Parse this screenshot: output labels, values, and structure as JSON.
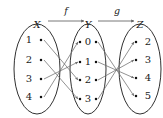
{
  "diagram": {
    "colors": {
      "ellipse": "#1a1a1a",
      "arrow": "#6e6e6e",
      "top_arrow": "#555555",
      "dot": "#111111",
      "text": "#1a1a1a",
      "background": "#ffffff"
    },
    "top_labels": {
      "set_x": "X",
      "map_f": "f",
      "set_y": "Y",
      "map_g": "g",
      "set_z": "Z"
    },
    "sets": [
      {
        "name": "X",
        "label": "X",
        "cx": 37,
        "cy": 69,
        "rx": 23,
        "ry": 45,
        "elements": [
          {
            "label": "1",
            "tx": 29,
            "ty": 40,
            "dx": 41,
            "dy": 40
          },
          {
            "label": "2",
            "tx": 29,
            "ty": 60,
            "dx": 41,
            "dy": 60
          },
          {
            "label": "3",
            "tx": 29,
            "ty": 79,
            "dx": 41,
            "dy": 79
          },
          {
            "label": "4",
            "tx": 29,
            "ty": 97,
            "dx": 41,
            "dy": 97
          }
        ]
      },
      {
        "name": "Y",
        "label": "Y",
        "cx": 88,
        "cy": 69,
        "rx": 18,
        "ry": 45,
        "elements": [
          {
            "label": "0",
            "tx": 88,
            "ty": 42,
            "dx_in": 80,
            "dy": 42,
            "dx_out": 96
          },
          {
            "label": "1",
            "tx": 88,
            "ty": 62,
            "dx_in": 80,
            "dy": 62,
            "dx_out": 96
          },
          {
            "label": "2",
            "tx": 88,
            "ty": 80,
            "dx_in": 80,
            "dy": 80,
            "dx_out": 96
          },
          {
            "label": "3",
            "tx": 88,
            "ty": 99,
            "dx_in": 80,
            "dy": 99,
            "dx_out": 96
          }
        ]
      },
      {
        "name": "Z",
        "label": "Z",
        "cx": 140,
        "cy": 69,
        "rx": 21,
        "ry": 45,
        "elements": [
          {
            "label": "2",
            "tx": 148,
            "ty": 42,
            "dx": 136,
            "dy": 42
          },
          {
            "label": "3",
            "tx": 148,
            "ty": 60,
            "dx": 136,
            "dy": 60
          },
          {
            "label": "4",
            "tx": 148,
            "ty": 78,
            "dx": 136,
            "dy": 78
          },
          {
            "label": "5",
            "tx": 148,
            "ty": 96,
            "dx": 136,
            "dy": 96
          }
        ]
      }
    ],
    "mappings": {
      "f": {
        "label": "f",
        "domain": "X",
        "codomain": "Y",
        "edges": [
          {
            "from": "1",
            "to": "2",
            "x1": 44,
            "y1": 40,
            "x2": 78,
            "y2": 80
          },
          {
            "from": "2",
            "to": "3",
            "x1": 44,
            "y1": 60,
            "x2": 78,
            "y2": 99
          },
          {
            "from": "3",
            "to": "1",
            "x1": 44,
            "y1": 79,
            "x2": 78,
            "y2": 62
          },
          {
            "from": "4",
            "to": "0",
            "x1": 44,
            "y1": 97,
            "x2": 78,
            "y2": 42
          }
        ]
      },
      "g": {
        "label": "g",
        "domain": "Y",
        "codomain": "Z",
        "crossing_point": {
          "x": 113,
          "y": 64
        },
        "edges": [
          {
            "from": "0",
            "to": "5",
            "x1": 98,
            "y1": 42,
            "x2": 134,
            "y2": 96
          },
          {
            "from": "1",
            "to": "4",
            "x1": 98,
            "y1": 62,
            "x2": 134,
            "y2": 78
          },
          {
            "from": "2",
            "to": "3",
            "x1": 98,
            "y1": 80,
            "x2": 134,
            "y2": 60
          },
          {
            "from": "3",
            "to": "2",
            "x1": 98,
            "y1": 99,
            "x2": 134,
            "y2": 42
          }
        ]
      }
    },
    "top_arrows": [
      {
        "name": "f-arrow",
        "x1": 48,
        "y1": 21,
        "x2": 84,
        "y2": 21,
        "label": "f",
        "lx": 66,
        "ly": 11
      },
      {
        "name": "g-arrow",
        "x1": 98,
        "y1": 21,
        "x2": 134,
        "y2": 21,
        "label": "g",
        "lx": 117,
        "ly": 11
      }
    ]
  }
}
